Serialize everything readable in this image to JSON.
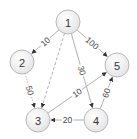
{
  "diagram": {
    "type": "weighted-directed-graph",
    "nodes": [
      {
        "id": "1",
        "label": "1",
        "x": 68,
        "y": 22
      },
      {
        "id": "2",
        "label": "2",
        "x": 22,
        "y": 62
      },
      {
        "id": "5",
        "label": "5",
        "x": 117,
        "y": 65
      },
      {
        "id": "3",
        "label": "3",
        "x": 38,
        "y": 120
      },
      {
        "id": "4",
        "label": "4",
        "x": 96,
        "y": 120
      }
    ],
    "edges": [
      {
        "from": "1",
        "to": "2",
        "weight": "10",
        "style": "solid"
      },
      {
        "from": "1",
        "to": "5",
        "weight": "100",
        "style": "solid"
      },
      {
        "from": "1",
        "to": "3",
        "weight": "",
        "style": "dashed"
      },
      {
        "from": "1",
        "to": "4",
        "weight": "30",
        "style": "solid"
      },
      {
        "from": "2",
        "to": "3",
        "weight": "50",
        "style": "dotted"
      },
      {
        "from": "3",
        "to": "5",
        "weight": "10",
        "style": "solid"
      },
      {
        "from": "4",
        "to": "3",
        "weight": "20",
        "style": "solid"
      },
      {
        "from": "4",
        "to": "5",
        "weight": "60",
        "style": "solid"
      }
    ],
    "colors": {
      "node_fill_top": "#ffffff",
      "node_fill_bottom": "#e6e6e6",
      "node_stroke": "#b8b8b8",
      "edge": "#9a9a9a",
      "arrow": "#333333",
      "text": "#333333"
    }
  }
}
